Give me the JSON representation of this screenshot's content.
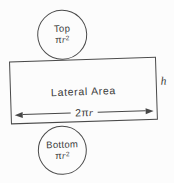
{
  "diagram": {
    "top_circle": {
      "label": "Top",
      "formula": {
        "pi": "π",
        "variable": "r",
        "exponent": "2"
      }
    },
    "bottom_circle": {
      "label": "Bottom",
      "formula": {
        "pi": "π",
        "variable": "r",
        "exponent": "2"
      }
    },
    "lateral_rectangle": {
      "label": "Lateral Area"
    },
    "width_dimension": {
      "coefficient": "2π",
      "variable": "r"
    },
    "height_dimension": {
      "label": "h"
    }
  },
  "colors": {
    "line": "#4a4a4a",
    "text": "#3a3a3a",
    "background": "#fcfcfc"
  }
}
